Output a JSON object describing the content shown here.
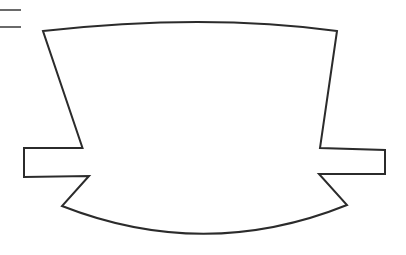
{
  "canvas": {
    "width": 406,
    "height": 255,
    "background_color": "#ffffff",
    "title": "Banner ribbon outline drawing"
  },
  "style": {
    "stroke_color": "#2b2b2b",
    "stroke_width": 2,
    "fill": "none",
    "tick_color": "#6a6a6a",
    "tick_width": 2
  },
  "drawing": {
    "name": "heraldic-banner-outline",
    "description": "Open line-art outline of a banner with concave flared sides, an arched top edge, a curved bottom edge, and rectangular ribbon tails extending left and right",
    "parts": [
      {
        "name": "banner-body-and-ribbons",
        "type": "outline-path",
        "path": "M 24 148 L 82.5 148 L 43 31 Q 205 13 337 31 L 320 148 L 385 150 L 385 174 L 319 174 L 347 205 Q 205 262 62 206 L 89 176 L 24 177 Z"
      },
      {
        "name": "tick-mark-upper",
        "type": "line",
        "x1": 0,
        "y1": 10,
        "x2": 21,
        "y2": 10
      },
      {
        "name": "tick-mark-lower",
        "type": "line",
        "x1": 0,
        "y1": 27,
        "x2": 21,
        "y2": 27
      }
    ],
    "geometry_notes": {
      "top_arc_apex": [
        205,
        14
      ],
      "top_left_vertex": [
        43,
        31
      ],
      "top_right_vertex": [
        337,
        31
      ],
      "left_ribbon_left_edge_x": 24,
      "left_ribbon_top_y": 148,
      "left_ribbon_bottom_y": 177,
      "right_ribbon_right_edge_x": 385,
      "right_ribbon_top_y": 150,
      "right_ribbon_bottom_y": 174,
      "left_notch_vertex": [
        62,
        206
      ],
      "right_notch_vertex": [
        347,
        205
      ],
      "bottom_arc_lowest_point": [
        205,
        237
      ]
    }
  }
}
